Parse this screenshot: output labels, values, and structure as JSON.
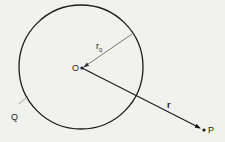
{
  "diagram": {
    "labels": {
      "center": "O",
      "radius": "r",
      "radius_subscript": "0",
      "vector": "r",
      "point_p": "P",
      "point_q": "Q"
    },
    "colors": {
      "background": "#f1f1ef",
      "stroke": "#1a1a1a",
      "thin_stroke": "#444444",
      "leader": "#777777"
    }
  }
}
